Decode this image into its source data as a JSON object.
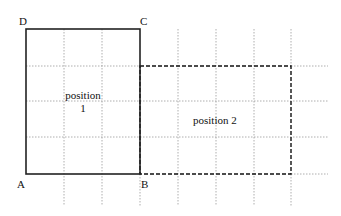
{
  "diagram": {
    "vertices": {
      "A": "A",
      "B": "B",
      "C": "C",
      "D": "D"
    },
    "position1": {
      "line1": "position",
      "line2": "1"
    },
    "position2": {
      "label": "position 2"
    },
    "colors": {
      "solid_rect": "#222222",
      "dashed_rect": "#111111",
      "grid": "#9a9a9a"
    }
  }
}
